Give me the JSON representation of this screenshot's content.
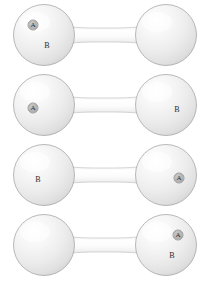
{
  "figure": {
    "background_color": "#ffffff",
    "width": 209,
    "height": 284,
    "shape_colors": {
      "sphere_highlight": "#fdfdfd",
      "sphere_mid": "#ededed",
      "sphere_shadow": "#d6d6d6",
      "sphere_outline": "#9e9e9e",
      "bar_fill": "#f7f7f7",
      "bar_edge": "#cfcfcf",
      "label_disc": "#b4b4b4",
      "label_text": "#2c2c2c"
    },
    "label_names": {
      "a": "A",
      "b": "B"
    },
    "rows": [
      {
        "id": "dumbbell-1",
        "top": 2,
        "labels": [
          {
            "text": "A",
            "style": "disc",
            "side": "left",
            "x": 33,
            "y": 23
          },
          {
            "text": "B",
            "style": "plain",
            "side": "left",
            "x": 47,
            "y": 44
          }
        ]
      },
      {
        "id": "dumbbell-2",
        "top": 72,
        "labels": [
          {
            "text": "A",
            "style": "disc",
            "side": "left",
            "x": 33,
            "y": 36
          },
          {
            "text": "B",
            "style": "plain",
            "side": "right",
            "x": 177,
            "y": 38
          }
        ]
      },
      {
        "id": "dumbbell-3",
        "top": 142,
        "labels": [
          {
            "text": "B",
            "style": "plain",
            "side": "left",
            "x": 38,
            "y": 38
          },
          {
            "text": "A",
            "style": "disc",
            "side": "right",
            "x": 179,
            "y": 36
          }
        ]
      },
      {
        "id": "dumbbell-4",
        "top": 212,
        "labels": [
          {
            "text": "A",
            "style": "disc",
            "side": "right",
            "x": 178,
            "y": 23
          },
          {
            "text": "B",
            "style": "plain",
            "side": "right",
            "x": 172,
            "y": 44
          }
        ]
      }
    ]
  }
}
